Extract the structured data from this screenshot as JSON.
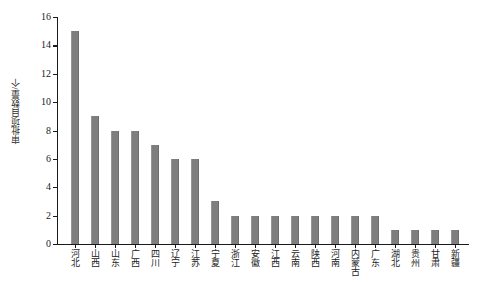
{
  "chart_data": {
    "type": "bar",
    "title": "",
    "xlabel": "",
    "ylabel": "审批项目数量/个",
    "ylim": [
      0,
      16
    ],
    "yticks": [
      0,
      2,
      4,
      6,
      8,
      10,
      12,
      14,
      16
    ],
    "grid": false,
    "legend": null,
    "bar_color": "#7e7e7e",
    "axis_color": "#1a1a1a",
    "categories": [
      "河北",
      "山西",
      "山东",
      "广西",
      "四川",
      "辽宁",
      "江苏",
      "宁夏",
      "浙江",
      "安徽",
      "江西",
      "云南",
      "陕西",
      "河南",
      "内蒙古",
      "广东",
      "湖北",
      "贵州",
      "甘肃",
      "新疆"
    ],
    "values": [
      15,
      9,
      8,
      8,
      7,
      6,
      6,
      3,
      2,
      2,
      2,
      2,
      2,
      2,
      2,
      2,
      1,
      1,
      1,
      1
    ]
  }
}
